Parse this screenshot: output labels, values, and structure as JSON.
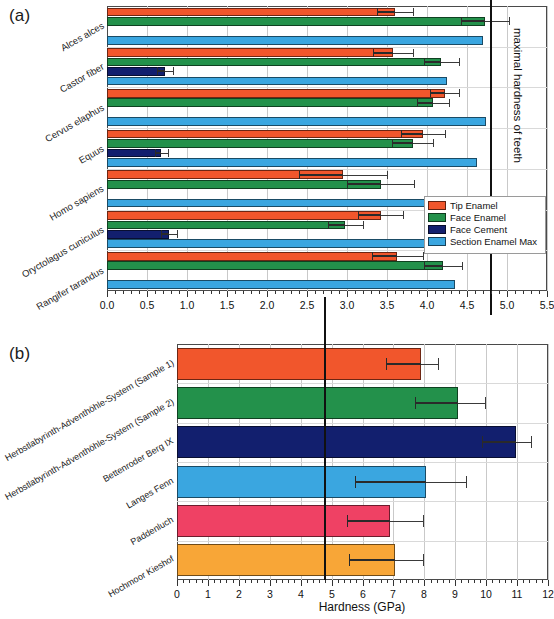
{
  "figure": {
    "panel_a_tag": "(a)",
    "panel_b_tag": "(b)",
    "reference_label": "maximal hardness of teeth"
  },
  "legend": {
    "items": [
      {
        "label": "Tip Enamel",
        "color": "#f1562c"
      },
      {
        "label": "Face Enamel",
        "color": "#23914b"
      },
      {
        "label": "Face Cement",
        "color": "#121f6e"
      },
      {
        "label": "Section Enamel Max",
        "color": "#3aa6e0"
      }
    ]
  },
  "chart_data": [
    {
      "type": "bar",
      "panel": "(a)",
      "orientation": "horizontal",
      "title": "",
      "xlabel": "",
      "ylabel": "",
      "xlim": [
        0.0,
        5.5
      ],
      "xticks": [
        0.0,
        0.5,
        1.0,
        1.5,
        2.0,
        2.5,
        3.0,
        3.5,
        4.0,
        4.5,
        5.0,
        5.5
      ],
      "xticklabels": [
        "0.0",
        "0.5",
        "1.0",
        "1.5",
        "2.0",
        "2.5",
        "3.0",
        "3.5",
        "4.0",
        "4.5",
        "5.0",
        "5.5"
      ],
      "minor_ticks_per_interval": 5,
      "grid": true,
      "legend_position": "inside lower right",
      "reference_line": {
        "value": 4.8,
        "label": "maximal hardness of teeth"
      },
      "categories": [
        "Alces alces",
        "Castor fiber",
        "Cervus elaphus",
        "Equus",
        "Homo sapiens",
        "Oryctolagus cuniculus",
        "Rangifer tarandus"
      ],
      "series": [
        {
          "name": "Tip Enamel",
          "color": "#f1562c",
          "values": [
            3.6,
            3.58,
            4.22,
            3.95,
            2.95,
            3.42,
            3.63
          ],
          "errors": [
            0.22,
            0.25,
            0.18,
            0.28,
            0.55,
            0.28,
            0.32
          ]
        },
        {
          "name": "Face Enamel",
          "color": "#23914b",
          "values": [
            4.72,
            4.18,
            4.08,
            3.82,
            3.42,
            2.98,
            4.2
          ],
          "errors": [
            0.3,
            0.22,
            0.2,
            0.26,
            0.42,
            0.22,
            0.24
          ]
        },
        {
          "name": "Face Cement",
          "color": "#121f6e",
          "values": [
            null,
            0.72,
            null,
            0.68,
            null,
            0.78,
            null
          ],
          "errors": [
            null,
            0.1,
            null,
            0.08,
            null,
            0.1,
            null
          ]
        },
        {
          "name": "Section Enamel Max",
          "color": "#3aa6e0",
          "values": [
            4.7,
            4.25,
            4.74,
            4.62,
            4.3,
            4.72,
            4.35
          ],
          "errors": [
            null,
            null,
            null,
            null,
            null,
            null,
            null
          ]
        }
      ]
    },
    {
      "type": "bar",
      "panel": "(b)",
      "orientation": "horizontal",
      "title": "",
      "xlabel": "Hardness (GPa)",
      "ylabel": "",
      "xlim": [
        0,
        12
      ],
      "xticks": [
        0,
        1,
        2,
        3,
        4,
        5,
        6,
        7,
        8,
        9,
        10,
        11,
        12
      ],
      "xticklabels": [
        "0",
        "1",
        "2",
        "3",
        "4",
        "5",
        "6",
        "7",
        "8",
        "9",
        "10",
        "11",
        "12"
      ],
      "minor_ticks_per_interval": 5,
      "grid": true,
      "reference_line": {
        "value": 4.8,
        "label": ""
      },
      "categories": [
        "Herbstlabyrinth-Adventhöhle-System (Sample 1)",
        "Herbstlabyrinth-Adventhöhle-System (Sample 2)",
        "Bettenroder Berg IX",
        "Langes Fenn",
        "Paddenluch",
        "Hochmoor Kieshof"
      ],
      "values": [
        7.9,
        9.1,
        10.95,
        8.05,
        6.9,
        7.05
      ],
      "errors_low": [
        6.75,
        7.7,
        9.85,
        5.75,
        5.5,
        5.55
      ],
      "errors_high": [
        8.45,
        9.95,
        11.45,
        9.35,
        7.95,
        7.95
      ],
      "colors": [
        "#f1562c",
        "#23914b",
        "#121f6e",
        "#3aa6e0",
        "#ef4164",
        "#f8a637"
      ]
    }
  ]
}
